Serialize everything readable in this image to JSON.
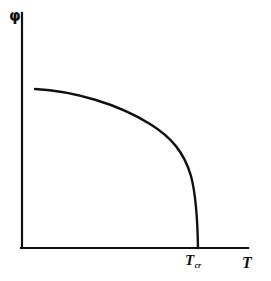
{
  "figure": {
    "background_color": "#ffffff",
    "ink_color": "#111111",
    "width": 271,
    "height": 281
  },
  "axes": {
    "y_axis_label": "φ",
    "x_axis_label": "T",
    "origin": {
      "x": 22,
      "y": 248
    },
    "y_axis_top": 13,
    "x_axis_right": 248,
    "line_width": 2.2
  },
  "annotations": {
    "critical_point_symbol": "T",
    "critical_point_subscript": "cr",
    "critical_point_x": 198
  },
  "chart_data": {
    "type": "line",
    "title": "",
    "subtitle": "",
    "xlabel": "T",
    "ylabel": "φ",
    "grid": false,
    "legend": null,
    "xlim": [
      0,
      1.15
    ],
    "ylim": [
      0,
      1.15
    ],
    "axis_ticks": {
      "x": [
        "T_cr"
      ],
      "y": []
    },
    "annotations": [
      {
        "text": "T_cr",
        "x": 0.78,
        "y": 0,
        "description": "critical temperature where the order parameter vanishes"
      }
    ],
    "series": [
      {
        "name": "order parameter",
        "color": "#111111",
        "line_width": 2.4,
        "comment": "Order parameter phi(T): nearly flat at low T, falls steeply with a vertical tangent at T_cr.",
        "x": [
          0.058,
          0.12,
          0.19,
          0.26,
          0.33,
          0.4,
          0.46,
          0.52,
          0.57,
          0.62,
          0.66,
          0.7,
          0.725,
          0.745,
          0.758,
          0.768,
          0.775,
          0.778,
          0.78
        ],
        "y": [
          0.677,
          0.672,
          0.663,
          0.65,
          0.632,
          0.608,
          0.58,
          0.546,
          0.51,
          0.464,
          0.414,
          0.348,
          0.292,
          0.228,
          0.168,
          0.11,
          0.052,
          0.018,
          0.0
        ]
      }
    ],
    "pixel_path": {
      "start": [
        35,
        89
      ],
      "knee": [
        185,
        150
      ],
      "end": [
        198,
        248
      ],
      "path_d": "M 35 89 C 74 91, 118 104, 150 124 C 171 137, 184 152, 191 176 C 196 195, 197.6 222, 198 248"
    }
  }
}
